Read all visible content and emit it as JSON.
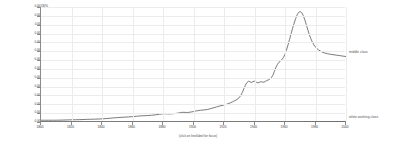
{
  "chart_data": {
    "type": "line",
    "title": "",
    "xlabel": "(click on line/label for focus)",
    "ylabel": "",
    "grid": true,
    "legend_position": "right-inline",
    "xlim": [
      1800,
      2000
    ],
    "ylim": [
      0.0,
      0.0013
    ],
    "x_ticks": [
      1800,
      1820,
      1840,
      1860,
      1880,
      1900,
      1920,
      1940,
      1960,
      1980,
      2000
    ],
    "y_ticks": [
      "0.00130%",
      "0.00120%",
      "0.00110%",
      "0.00100%",
      "0.00090%",
      "0.00080%",
      "0.00070%",
      "0.00060%",
      "0.00050%",
      "0.00040%",
      "0.00030%",
      "0.00020%",
      "0.00010%",
      "0.00000%"
    ],
    "series": [
      {
        "name": "middle class",
        "color": "#6b6b6b",
        "x": [
          1800,
          1805,
          1810,
          1815,
          1820,
          1825,
          1830,
          1835,
          1840,
          1845,
          1850,
          1855,
          1860,
          1865,
          1870,
          1875,
          1880,
          1885,
          1890,
          1893,
          1896,
          1900,
          1903,
          1906,
          1909,
          1912,
          1915,
          1918,
          1921,
          1924,
          1927,
          1930,
          1932,
          1934,
          1936,
          1938,
          1940,
          1942,
          1944,
          1946,
          1948,
          1950,
          1952,
          1954,
          1956,
          1958,
          1960,
          1962,
          1964,
          1966,
          1968,
          1970,
          1972,
          1974,
          1976,
          1978,
          1980,
          1984,
          1988,
          1992,
          1996,
          2000
        ],
        "y": [
          2e-05,
          2e-05,
          2e-05,
          2.2e-05,
          2.5e-05,
          2.6e-05,
          3e-05,
          3.2e-05,
          3.5e-05,
          4.2e-05,
          5e-05,
          5.5e-05,
          6e-05,
          7e-05,
          7.2e-05,
          8e-05,
          9.5e-05,
          9e-05,
          0.0001,
          0.000112,
          0.000105,
          0.000118,
          0.00013,
          0.000135,
          0.00014,
          0.000155,
          0.00017,
          0.000185,
          0.000195,
          0.000215,
          0.00024,
          0.00027,
          0.00033,
          0.00042,
          0.00047,
          0.00044,
          0.00047,
          0.000435,
          0.00046,
          0.000445,
          0.00047,
          0.00048,
          0.00052,
          0.00062,
          0.00068,
          0.0007,
          0.00076,
          0.00087,
          0.001,
          0.00112,
          0.00122,
          0.00126,
          0.00121,
          0.0011,
          0.00098,
          0.0009,
          0.00084,
          0.00079,
          0.00077,
          0.00076,
          0.00075,
          0.00074
        ]
      },
      {
        "name": "white working class",
        "color": "#6b6b6b",
        "x": [
          1800,
          1900,
          1950,
          1970,
          1985,
          2000
        ],
        "y": [
          0.0,
          0.0,
          0.0,
          2e-06,
          4e-06,
          6e-06
        ]
      }
    ]
  },
  "labels": {
    "middle_class": "middle class",
    "white_working_class": "white working class",
    "x_caption": "(click on line/label for focus)"
  }
}
